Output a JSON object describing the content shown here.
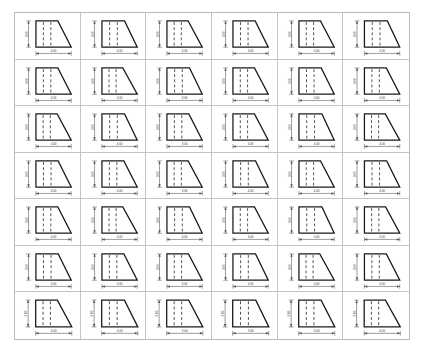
{
  "sheet": {
    "title": "Trapezoid dimension drawing grid",
    "columns": 6,
    "rows": 7,
    "cell_count": 42,
    "background_color": "#ffffff",
    "border_color": "#b9b9b9",
    "cell_border_color": "#c4c4c4",
    "line_color": "#1a1a1a",
    "dim_line_color": "#555555",
    "dashed_line_color": "#444444"
  },
  "figure_template": {
    "shape": "trapezoid",
    "description": "Right trapezoid: vertical left edge, horizontal top edge, horizontal bottom edge, slanted right edge",
    "interior_lines": 2,
    "interior_line_style": "dashed",
    "height_dimension_position": "left",
    "width_dimension_position": "bottom",
    "height_label": "3.00",
    "width_label": "4.00"
  },
  "cells": [
    {
      "id": "r1c1",
      "height_label": "3.00",
      "width_label": "4.00",
      "slant": 0.42,
      "top_ratio": 0.62
    },
    {
      "id": "r1c2",
      "height_label": "3.00",
      "width_label": "4.00",
      "slant": 0.4,
      "top_ratio": 0.64
    },
    {
      "id": "r1c3",
      "height_label": "3.00",
      "width_label": "4.00",
      "slant": 0.44,
      "top_ratio": 0.6
    },
    {
      "id": "r1c4",
      "height_label": "3.00",
      "width_label": "4.00",
      "slant": 0.41,
      "top_ratio": 0.63
    },
    {
      "id": "r1c5",
      "height_label": "3.00",
      "width_label": "4.00",
      "slant": 0.43,
      "top_ratio": 0.61
    },
    {
      "id": "r1c6",
      "height_label": "3.00",
      "width_label": "4.00",
      "slant": 0.39,
      "top_ratio": 0.65
    },
    {
      "id": "r2c1",
      "height_label": "3.00",
      "width_label": "4.00",
      "slant": 0.42,
      "top_ratio": 0.62
    },
    {
      "id": "r2c2",
      "height_label": "3.00",
      "width_label": "4.00",
      "slant": 0.45,
      "top_ratio": 0.59
    },
    {
      "id": "r2c3",
      "height_label": "3.00",
      "width_label": "3.00",
      "slant": 0.4,
      "top_ratio": 0.64
    },
    {
      "id": "r2c4",
      "height_label": "3.00",
      "width_label": "4.00",
      "slant": 0.43,
      "top_ratio": 0.61
    },
    {
      "id": "r2c5",
      "height_label": "3.00",
      "width_label": "4.00",
      "slant": 0.41,
      "top_ratio": 0.63
    },
    {
      "id": "r2c6",
      "height_label": "3.00",
      "width_label": "4.00",
      "slant": 0.42,
      "top_ratio": 0.62
    },
    {
      "id": "r3c1",
      "height_label": "3.00",
      "width_label": "4.00",
      "slant": 0.44,
      "top_ratio": 0.6
    },
    {
      "id": "r3c2",
      "height_label": "3.00",
      "width_label": "4.00",
      "slant": 0.4,
      "top_ratio": 0.64
    },
    {
      "id": "r3c3",
      "height_label": "3.00",
      "width_label": "3.00",
      "slant": 0.42,
      "top_ratio": 0.62
    },
    {
      "id": "r3c4",
      "height_label": "3.00",
      "width_label": "4.00",
      "slant": 0.43,
      "top_ratio": 0.61
    },
    {
      "id": "r3c5",
      "height_label": "3.00",
      "width_label": "4.00",
      "slant": 0.39,
      "top_ratio": 0.65
    },
    {
      "id": "r3c6",
      "height_label": "3.00",
      "width_label": "4.00",
      "slant": 0.45,
      "top_ratio": 0.59
    },
    {
      "id": "r4c1",
      "height_label": "3.00",
      "width_label": "4.00",
      "slant": 0.41,
      "top_ratio": 0.63
    },
    {
      "id": "r4c2",
      "height_label": "3.00",
      "width_label": "4.00",
      "slant": 0.42,
      "top_ratio": 0.62
    },
    {
      "id": "r4c3",
      "height_label": "3.00",
      "width_label": "3.00",
      "slant": 0.44,
      "top_ratio": 0.6
    },
    {
      "id": "r4c4",
      "height_label": "3.00",
      "width_label": "4.00",
      "slant": 0.4,
      "top_ratio": 0.64
    },
    {
      "id": "r4c5",
      "height_label": "3.00",
      "width_label": "4.00",
      "slant": 0.43,
      "top_ratio": 0.61
    },
    {
      "id": "r4c6",
      "height_label": "3.00",
      "width_label": "4.00",
      "slant": 0.41,
      "top_ratio": 0.63
    },
    {
      "id": "r5c1",
      "height_label": "3.00",
      "width_label": "4.00",
      "slant": 0.42,
      "top_ratio": 0.62
    },
    {
      "id": "r5c2",
      "height_label": "3.00",
      "width_label": "4.00",
      "slant": 0.45,
      "top_ratio": 0.59
    },
    {
      "id": "r5c3",
      "height_label": "3.00",
      "width_label": "4.00",
      "slant": 0.4,
      "top_ratio": 0.64
    },
    {
      "id": "r5c4",
      "height_label": "3.00",
      "width_label": "4.00",
      "slant": 0.43,
      "top_ratio": 0.61
    },
    {
      "id": "r5c5",
      "height_label": "3.00",
      "width_label": "4.00",
      "slant": 0.39,
      "top_ratio": 0.65
    },
    {
      "id": "r5c6",
      "height_label": "3.00",
      "width_label": "4.00",
      "slant": 0.44,
      "top_ratio": 0.6
    },
    {
      "id": "r6c1",
      "height_label": "3.00",
      "width_label": "4.00",
      "slant": 0.41,
      "top_ratio": 0.63
    },
    {
      "id": "r6c2",
      "height_label": "3.00",
      "width_label": "4.00",
      "slant": 0.42,
      "top_ratio": 0.62
    },
    {
      "id": "r6c3",
      "height_label": "3.00",
      "width_label": "4.00",
      "slant": 0.43,
      "top_ratio": 0.61
    },
    {
      "id": "r6c4",
      "height_label": "3.00",
      "width_label": "4.00",
      "slant": 0.4,
      "top_ratio": 0.64
    },
    {
      "id": "r6c5",
      "height_label": "3.00",
      "width_label": "4.00",
      "slant": 0.45,
      "top_ratio": 0.59
    },
    {
      "id": "r6c6",
      "height_label": "3.00",
      "width_label": "4.00",
      "slant": 0.42,
      "top_ratio": 0.62
    },
    {
      "id": "r7c1",
      "height_label": "3.00",
      "width_label": "4.00",
      "slant": 0.44,
      "top_ratio": 0.6
    },
    {
      "id": "r7c2",
      "height_label": "3.00",
      "width_label": "4.00",
      "slant": 0.41,
      "top_ratio": 0.63
    },
    {
      "id": "r7c3",
      "height_label": "3.00",
      "width_label": "3.00",
      "slant": 0.43,
      "top_ratio": 0.61
    },
    {
      "id": "r7c4",
      "height_label": "3.00",
      "width_label": "3.00",
      "slant": 0.4,
      "top_ratio": 0.64
    },
    {
      "id": "r7c5",
      "height_label": "3.00",
      "width_label": "4.00",
      "slant": 0.42,
      "top_ratio": 0.62
    },
    {
      "id": "r7c6",
      "height_label": "3.00",
      "width_label": "4.00",
      "slant": 0.45,
      "top_ratio": 0.59
    }
  ]
}
